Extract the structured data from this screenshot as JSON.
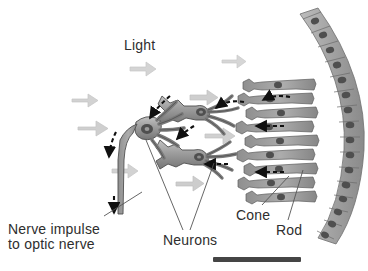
{
  "figure": {
    "kind": "anatomy-diagram",
    "background_color": "#ffffff"
  },
  "labels": {
    "light": "Light",
    "nerve_impulse": "Nerve impulse\nto optic nerve",
    "neurons": "Neurons",
    "cone": "Cone",
    "rod": "Rod"
  },
  "colors": {
    "light_arrow": "#d2d2d2",
    "light_arrow_edge": "#bfbfbf",
    "cell_fill": "#9a9a9a",
    "cell_fill_light": "#b6b6b6",
    "cell_fill_dark": "#7b7b7b",
    "cell_outline": "#4a4a4a",
    "nucleus": "#4f4f4f",
    "epithelium_fill": "#a8a8a8",
    "signal_arrow": "#101010",
    "leader_line": "#555555",
    "text": "#2e2e2e",
    "scale_bar": "#454545"
  },
  "light_arrows": [
    {
      "x": 72,
      "y": 94,
      "w": 26,
      "h": 13
    },
    {
      "x": 78,
      "y": 121,
      "w": 30,
      "h": 15
    },
    {
      "x": 130,
      "y": 62,
      "w": 26,
      "h": 14
    },
    {
      "x": 190,
      "y": 90,
      "w": 28,
      "h": 15
    },
    {
      "x": 222,
      "y": 55,
      "w": 24,
      "h": 13
    },
    {
      "x": 205,
      "y": 128,
      "w": 30,
      "h": 16
    },
    {
      "x": 112,
      "y": 164,
      "w": 26,
      "h": 14
    },
    {
      "x": 176,
      "y": 176,
      "w": 28,
      "h": 15
    }
  ],
  "signal_arrows": [
    {
      "from": [
        168,
        100
      ],
      "to": [
        148,
        122
      ],
      "note": "into-ganglion"
    },
    {
      "from": [
        113,
        133
      ],
      "to": [
        108,
        158
      ],
      "note": "down-axon"
    },
    {
      "from": [
        113,
        195
      ],
      "to": [
        113,
        214
      ],
      "note": "axon-exit"
    },
    {
      "from": [
        243,
        104
      ],
      "to": [
        215,
        110
      ],
      "note": "bipolar-upper"
    },
    {
      "from": [
        192,
        129
      ],
      "to": [
        176,
        140
      ],
      "note": "bipolar-mid"
    },
    {
      "from": [
        227,
        164
      ],
      "to": [
        204,
        164
      ],
      "note": "bipolar-lower"
    },
    {
      "from": [
        288,
        98
      ],
      "to": [
        262,
        101
      ],
      "note": "photoreceptor-1"
    },
    {
      "from": [
        283,
        126
      ],
      "to": [
        255,
        126
      ],
      "note": "photoreceptor-2"
    },
    {
      "from": [
        283,
        172
      ],
      "to": [
        255,
        172
      ],
      "note": "photoreceptor-3"
    }
  ],
  "photoreceptors": [
    {
      "y": 86,
      "type": "cone"
    },
    {
      "y": 100,
      "type": "rod"
    },
    {
      "y": 114,
      "type": "cone"
    },
    {
      "y": 128,
      "type": "rod"
    },
    {
      "y": 142,
      "type": "cone"
    },
    {
      "y": 156,
      "type": "rod"
    },
    {
      "y": 170,
      "type": "cone"
    },
    {
      "y": 184,
      "type": "rod"
    },
    {
      "y": 198,
      "type": "cone"
    }
  ],
  "epithelium": {
    "cell_count": 18,
    "arc_note": "curved pigment epithelium along right edge"
  },
  "scale_bar": {
    "x": 213,
    "y": 257,
    "width": 88,
    "height": 5
  }
}
